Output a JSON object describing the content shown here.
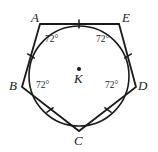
{
  "figure": {
    "type": "geometry-diagram",
    "stroke_color": "#1a1a1a",
    "background_color": "#ffffff",
    "vertices": [
      {
        "name": "A",
        "label": "A",
        "x": 40,
        "y": 24,
        "label_x": 31,
        "label_y": 11
      },
      {
        "name": "E",
        "label": "E",
        "x": 119,
        "y": 24,
        "label_x": 122,
        "label_y": 11
      },
      {
        "name": "D",
        "label": "D",
        "x": 136,
        "y": 87,
        "label_x": 138,
        "label_y": 79
      },
      {
        "name": "C",
        "label": "C",
        "x": 79,
        "y": 131,
        "label_x": 74,
        "label_y": 134
      },
      {
        "name": "B",
        "label": "B",
        "x": 22,
        "y": 87,
        "label_x": 9,
        "label_y": 79
      }
    ],
    "center": {
      "name": "K",
      "label": "K",
      "x": 79,
      "y": 76,
      "dot_x": 79,
      "dot_y": 69,
      "dot_radius": 2,
      "label_x": 74,
      "label_y": 72
    },
    "circle": {
      "cx": 79,
      "cy": 76,
      "r": 50
    },
    "angle_labels": [
      {
        "name": "angle-at-a",
        "text": "72°",
        "x": 45,
        "y": 35,
        "vertex": "A"
      },
      {
        "name": "angle-at-e",
        "text": "72°",
        "x": 96,
        "y": 35,
        "vertex": "E"
      },
      {
        "name": "angle-at-b",
        "text": "72°",
        "x": 36,
        "y": 81,
        "vertex": "B"
      },
      {
        "name": "angle-at-d",
        "text": "72°",
        "x": 105,
        "y": 81,
        "vertex": "D"
      }
    ],
    "side_ticks": [
      {
        "name": "tick-side-ae",
        "x": 79,
        "y": 24,
        "angle": 90
      },
      {
        "name": "tick-side-ed",
        "x": 128,
        "y": 56,
        "angle": 32
      },
      {
        "name": "tick-side-dc",
        "x": 108,
        "y": 110,
        "angle": -37
      },
      {
        "name": "tick-side-cb",
        "x": 50,
        "y": 110,
        "angle": 37
      },
      {
        "name": "tick-side-ba",
        "x": 31,
        "y": 56,
        "angle": -32
      }
    ]
  }
}
